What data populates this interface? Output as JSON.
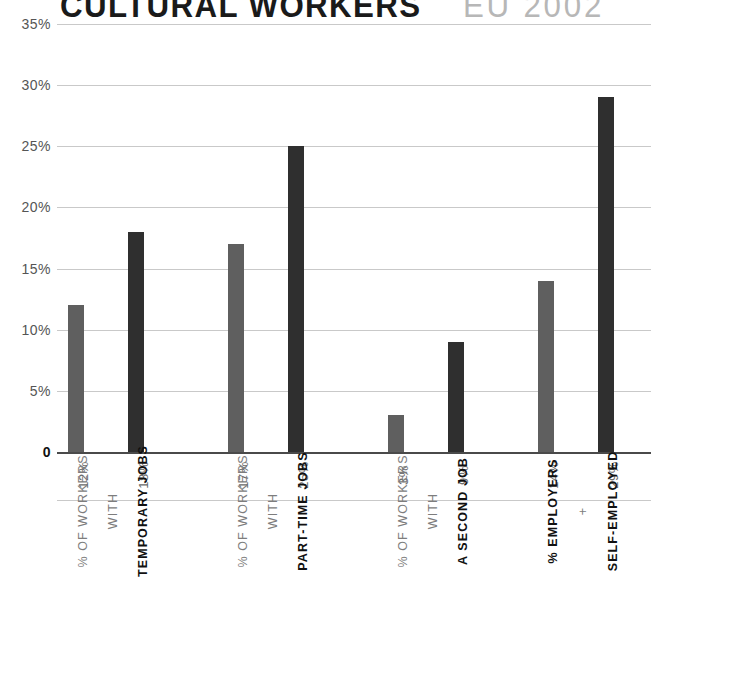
{
  "title": {
    "main": "CULTURAL WORKERS",
    "sub": "EU 2002"
  },
  "colors": {
    "bar_light": "#5f5f5f",
    "bar_dark": "#2f2f2f",
    "gridline": "#c9c9c9",
    "baseline": "#4a4a4a",
    "title_main": "#1a1a1a",
    "title_sub": "#b7b7b7",
    "label_light": "#7d7d7d",
    "label_bold": "#111111"
  },
  "chart_data": {
    "type": "bar",
    "subtitle": "EU 2002",
    "xlabel": "",
    "ylabel": "",
    "ylim": [
      0,
      35
    ],
    "grid": true,
    "legend": "none",
    "ytick_labels": [
      "35%",
      "30%",
      "25%",
      "20%",
      "15%",
      "10%",
      "5%",
      "0"
    ],
    "ytick_values": [
      35,
      30,
      25,
      20,
      15,
      10,
      5,
      0
    ],
    "categories": [
      "% OF WORKERS WITH TEMPORARY JOBS",
      "% OF WORKERS WITH TEMPORARY JOBS",
      "% OF WORKERS WITH PART-TIME JOBS",
      "% OF WORKERS WITH PART-TIME JOBS",
      "% OF WORKERS WITH A SECOND JOB",
      "% OF WORKERS WITH A SECOND JOB",
      "% EMPLOYERS + SELF-EMPLOYED",
      "% EMPLOYERS + SELF-EMPLOYED"
    ],
    "values": [
      12,
      18,
      17,
      25,
      3,
      9,
      14,
      29
    ],
    "value_labels": [
      "12%",
      "18%",
      "17%",
      "25%",
      "3%",
      "9%",
      "14%",
      "29%"
    ]
  },
  "bars": [
    {
      "value": 12,
      "value_label": "12%",
      "tone": "light",
      "x": 11
    },
    {
      "value": 18,
      "value_label": "18%",
      "tone": "dark",
      "x": 71
    },
    {
      "value": 17,
      "value_label": "17%",
      "tone": "light",
      "x": 171
    },
    {
      "value": 25,
      "value_label": "25%",
      "tone": "dark",
      "x": 231
    },
    {
      "value": 3,
      "value_label": "3%",
      "tone": "light",
      "x": 331
    },
    {
      "value": 9,
      "value_label": "9%",
      "tone": "dark",
      "x": 391
    },
    {
      "value": 14,
      "value_label": "14%",
      "tone": "light",
      "x": 481
    },
    {
      "value": 29,
      "value_label": "29%",
      "tone": "dark",
      "x": 541
    }
  ],
  "category_labels": [
    {
      "text": "% OF WORKERS",
      "weight": "light",
      "x": 11
    },
    {
      "text": "WITH",
      "weight": "light",
      "x": 41
    },
    {
      "text": "TEMPORARY JOBS",
      "weight": "bold",
      "x": 71
    },
    {
      "text": "% OF WORKERS",
      "weight": "light",
      "x": 171
    },
    {
      "text": "WITH",
      "weight": "light",
      "x": 201
    },
    {
      "text": "PART-TIME JOBS",
      "weight": "bold",
      "x": 231
    },
    {
      "text": "% OF WORKERS",
      "weight": "light",
      "x": 331
    },
    {
      "text": "WITH",
      "weight": "light",
      "x": 361
    },
    {
      "text": "A SECOND JOB",
      "weight": "bold",
      "x": 391
    },
    {
      "text": "% EMPLOYERS",
      "weight": "bold",
      "x": 481
    },
    {
      "text": "+",
      "weight": "light",
      "x": 511
    },
    {
      "text": "SELF-EMPLOYED",
      "weight": "bold",
      "x": 541
    }
  ]
}
